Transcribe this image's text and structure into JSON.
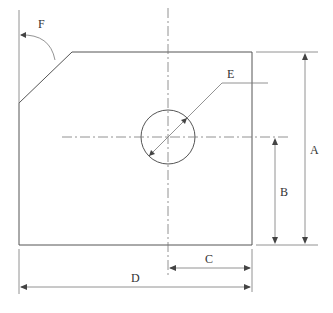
{
  "drawing": {
    "type": "technical-drawing",
    "description": "Plate with chamfered corner and circular hole, dimensioned",
    "labels": {
      "A": "A",
      "B": "B",
      "C": "C",
      "D": "D",
      "E": "E",
      "F": "F"
    },
    "dimensions": [
      {
        "id": "A",
        "meaning": "overall height",
        "orientation": "vertical"
      },
      {
        "id": "B",
        "meaning": "hole center height from bottom",
        "orientation": "vertical"
      },
      {
        "id": "C",
        "meaning": "hole center distance from right edge",
        "orientation": "horizontal"
      },
      {
        "id": "D",
        "meaning": "overall width",
        "orientation": "horizontal"
      },
      {
        "id": "E",
        "meaning": "hole diameter",
        "orientation": "leader"
      },
      {
        "id": "F",
        "meaning": "chamfer angle",
        "orientation": "angular"
      }
    ],
    "colors": {
      "stroke": "#555555",
      "background": "#ffffff"
    }
  }
}
